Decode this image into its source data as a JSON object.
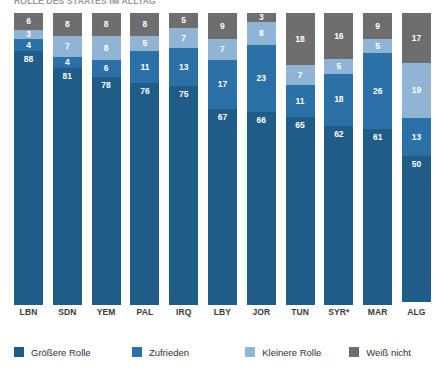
{
  "chart_data": {
    "type": "bar",
    "title": "ROLLE DES STAATES IM ALLTAG",
    "subtitle": "",
    "xlabel": "",
    "ylabel": "",
    "ylim": [
      0,
      100
    ],
    "stacked": true,
    "stack_total": 100,
    "grid": false,
    "legend_position": "bottom",
    "categories": [
      "LBN",
      "SDN",
      "YEM",
      "PAL",
      "IRQ",
      "LBY",
      "JOR",
      "TUN",
      "SYR*",
      "MAR",
      "ALG"
    ],
    "series": [
      {
        "name": "Größere Rolle",
        "color": "#1f5c87",
        "values": [
          88,
          81,
          78,
          76,
          75,
          67,
          66,
          65,
          62,
          61,
          50
        ]
      },
      {
        "name": "Zufrieden",
        "color": "#2b71a8",
        "values": [
          4,
          4,
          6,
          11,
          13,
          17,
          23,
          11,
          18,
          26,
          13
        ]
      },
      {
        "name": "Kleinere Rolle",
        "color": "#8fb4d4",
        "values": [
          3,
          7,
          8,
          5,
          7,
          7,
          8,
          7,
          5,
          5,
          19
        ]
      },
      {
        "name": "Weiß nicht",
        "color": "#6e6e6e",
        "values": [
          6,
          8,
          8,
          8,
          5,
          9,
          3,
          18,
          16,
          9,
          17
        ]
      }
    ]
  },
  "legend": {
    "items": [
      {
        "label": "Größere Rolle",
        "color": "#1f5c87"
      },
      {
        "label": "Zufrieden",
        "color": "#2b71a8"
      },
      {
        "label": "Kleinere Rolle",
        "color": "#8fb4d4"
      },
      {
        "label": "Weiß nicht",
        "color": "#6e6e6e"
      }
    ]
  }
}
